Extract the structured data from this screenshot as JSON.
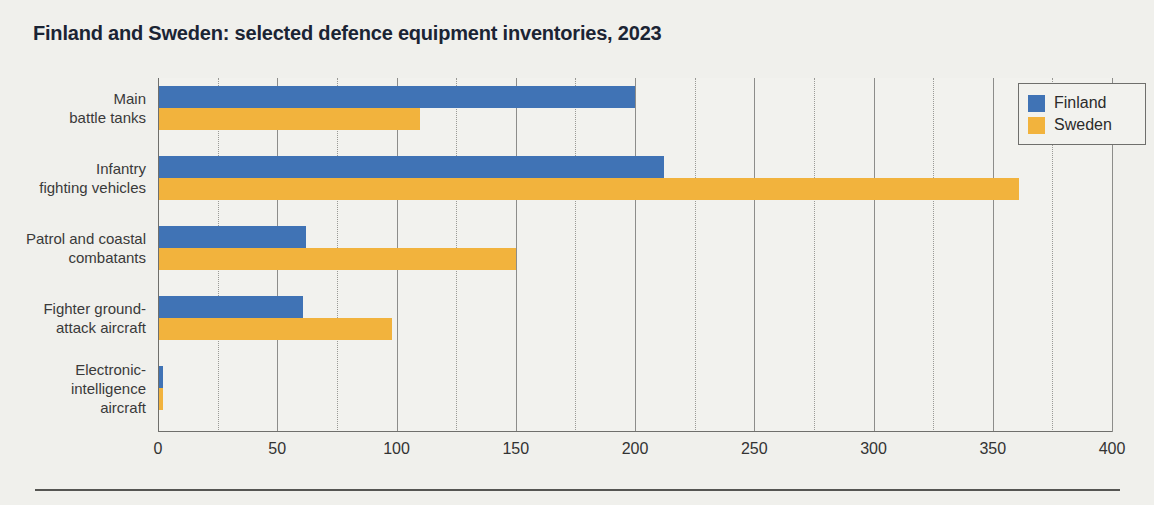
{
  "chart_data": {
    "type": "bar",
    "orientation": "horizontal",
    "title": "Finland and Sweden: selected defence equipment inventories, 2023",
    "xlabel": "",
    "ylabel": "",
    "xlim": [
      0,
      400
    ],
    "xticks": [
      0,
      50,
      100,
      150,
      200,
      250,
      300,
      350,
      400
    ],
    "xtick_labels": [
      "0",
      "50",
      "100",
      "150",
      "200",
      "250",
      "300",
      "350",
      "400"
    ],
    "minor_tick_interval": 25,
    "grid": true,
    "legend_position": "top-right",
    "categories": [
      "Main battle tanks",
      "Infantry fighting vehicles",
      "Patrol and coastal combatants",
      "Fighter ground-attack aircraft",
      "Electronic-intelligence aircraft"
    ],
    "category_label_lines": [
      [
        "Main",
        "battle tanks"
      ],
      [
        "Infantry",
        "fighting vehicles"
      ],
      [
        "Patrol and coastal",
        "combatants"
      ],
      [
        "Fighter ground-",
        "attack aircraft"
      ],
      [
        "Electronic-",
        "intelligence",
        "aircraft"
      ]
    ],
    "series": [
      {
        "name": "Finland",
        "color": "#4073b5",
        "values": [
          200,
          212,
          62,
          61,
          2
        ]
      },
      {
        "name": "Sweden",
        "color": "#f2b33d",
        "values": [
          110,
          361,
          150,
          98,
          2
        ]
      }
    ]
  },
  "legend": {
    "items": [
      {
        "label": "Finland",
        "color": "#4073b5"
      },
      {
        "label": "Sweden",
        "color": "#f2b33d"
      }
    ]
  },
  "colors": {
    "background": "#f0f0ec",
    "plot_background": "#f2f2ee",
    "title": "#1b2434",
    "axis": "#6f6f6c",
    "gridline_major": "#8d8d8a",
    "gridline_minor": "#9a9a96",
    "rule": "#555552"
  }
}
